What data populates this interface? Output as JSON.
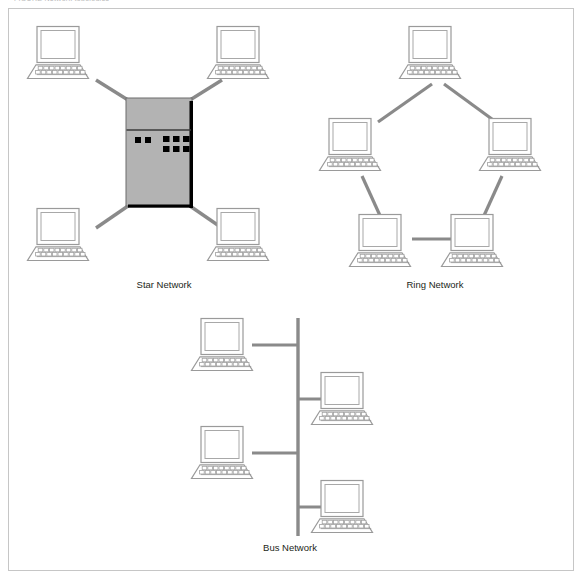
{
  "figure": {
    "top_caption": "FIGURE       Network topologies",
    "frame_color": "#c6c6c6",
    "background": "#ffffff"
  },
  "colors": {
    "link_line": "#8a8a8a",
    "device_outline": "#9a9a9a",
    "device_fill": "#ffffff",
    "server_fill": "#b3b3b3",
    "server_edge": "#000000",
    "server_indicator": "#000000",
    "label_text": "#231f20"
  },
  "topologies": [
    {
      "id": "star",
      "label": "Star Network",
      "label_x": 164,
      "label_y": 288,
      "node_count": 4,
      "has_central_server": true,
      "description": "Four workstations connected by individual links to a central server hub",
      "server": {
        "x": 126,
        "y": 98,
        "width": 66,
        "height": 108,
        "divider_y": 130,
        "left_indicators": 2,
        "right_indicator_cols": 3,
        "right_indicator_rows": 2
      },
      "computers": [
        {
          "name": "star-node-top-left",
          "x": 26,
          "y": 26
        },
        {
          "name": "star-node-top-right",
          "x": 206,
          "y": 26
        },
        {
          "name": "star-node-bottom-left",
          "x": 26,
          "y": 208
        },
        {
          "name": "star-node-bottom-right",
          "x": 206,
          "y": 208
        }
      ],
      "links": [
        {
          "name": "star-link-top-left",
          "x1": 96,
          "y1": 80,
          "x2": 128,
          "y2": 100
        },
        {
          "name": "star-link-top-right",
          "x1": 222,
          "y1": 80,
          "x2": 190,
          "y2": 100
        },
        {
          "name": "star-link-bottom-left",
          "x1": 96,
          "y1": 228,
          "x2": 128,
          "y2": 206
        },
        {
          "name": "star-link-bottom-right",
          "x1": 222,
          "y1": 228,
          "x2": 190,
          "y2": 206
        }
      ]
    },
    {
      "id": "ring",
      "label": "Ring Network",
      "label_x": 435,
      "label_y": 288,
      "node_count": 5,
      "has_central_server": false,
      "description": "Five workstations arranged in a pentagon, each linked to its two neighbours forming a closed loop",
      "computers": [
        {
          "name": "ring-node-top",
          "x": 398,
          "y": 26
        },
        {
          "name": "ring-node-left",
          "x": 318,
          "y": 118
        },
        {
          "name": "ring-node-right",
          "x": 478,
          "y": 118
        },
        {
          "name": "ring-node-bottom-left",
          "x": 358,
          "y": 214
        },
        {
          "name": "ring-node-bottom-right",
          "x": 448,
          "y": 214
        }
      ],
      "links": [
        {
          "name": "ring-link-top-to-left",
          "x1": 432,
          "y1": 84,
          "x2": 378,
          "y2": 122
        },
        {
          "name": "ring-link-top-to-right",
          "x1": 444,
          "y1": 84,
          "x2": 496,
          "y2": 122
        },
        {
          "name": "ring-link-left-to-bottom-left",
          "x1": 362,
          "y1": 178,
          "x2": 382,
          "y2": 218
        },
        {
          "name": "ring-link-right-to-bottom-right",
          "x1": 502,
          "y1": 178,
          "x2": 482,
          "y2": 218
        },
        {
          "name": "ring-link-bottom-left-to-right",
          "x1": 412,
          "y1": 239,
          "x2": 450,
          "y2": 239
        }
      ]
    },
    {
      "id": "bus",
      "label": "Bus Network",
      "label_x": 290,
      "label_y": 551,
      "node_count": 4,
      "has_central_server": false,
      "description": "Four workstations tapped off a single vertical backbone cable, alternating left and right",
      "backbone": {
        "x": 298,
        "y1": 318,
        "y2": 536
      },
      "computers": [
        {
          "name": "bus-node-left-upper",
          "x": 196,
          "y": 318
        },
        {
          "name": "bus-node-right-upper",
          "x": 304,
          "y": 372
        },
        {
          "name": "bus-node-left-lower",
          "x": 196,
          "y": 426
        },
        {
          "name": "bus-node-right-lower",
          "x": 304,
          "y": 480
        }
      ],
      "links": [
        {
          "name": "bus-stub-left-upper",
          "x1": 250,
          "y1": 345,
          "x2": 298,
          "y2": 345
        },
        {
          "name": "bus-stub-right-upper",
          "x1": 298,
          "y1": 399,
          "x2": 346,
          "y2": 399
        },
        {
          "name": "bus-stub-left-lower",
          "x1": 250,
          "y1": 453,
          "x2": 298,
          "y2": 453
        },
        {
          "name": "bus-stub-right-lower",
          "x1": 298,
          "y1": 507,
          "x2": 346,
          "y2": 507
        }
      ]
    }
  ],
  "computer_icon": {
    "name": "desktop-computer-icon",
    "width": 64,
    "height": 54,
    "monitor": {
      "x": 11,
      "y": 0,
      "w": 42,
      "h": 36
    },
    "screen_inset": 4,
    "keyboard_top_row_keys": 9,
    "keyboard_bottom_row_keys": 10
  }
}
